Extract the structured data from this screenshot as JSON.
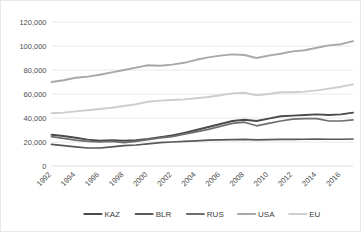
{
  "chart_data": {
    "type": "line",
    "title": "",
    "xlabel": "",
    "ylabel": "",
    "ylim": [
      0,
      120000
    ],
    "ytick_labels": [
      "120,000",
      "100,000",
      "80,000",
      "60,000",
      "40,000",
      "20,000",
      "0"
    ],
    "ytick_values": [
      120000,
      100000,
      80000,
      60000,
      40000,
      20000,
      0
    ],
    "grid": "horizontal",
    "legend_position": "bottom",
    "x": [
      1992,
      1993,
      1994,
      1995,
      1996,
      1997,
      1998,
      1999,
      2000,
      2001,
      2002,
      2003,
      2004,
      2005,
      2006,
      2007,
      2008,
      2009,
      2010,
      2011,
      2012,
      2013,
      2014,
      2015,
      2016,
      2017
    ],
    "xtick_labels": [
      "1992",
      "1994",
      "1996",
      "1998",
      "2000",
      "2002",
      "2004",
      "2006",
      "2008",
      "2010",
      "2012",
      "2014",
      "2016"
    ],
    "xtick_values": [
      1992,
      1994,
      1996,
      1998,
      2000,
      2002,
      2004,
      2006,
      2008,
      2010,
      2012,
      2014,
      2016
    ],
    "series": [
      {
        "name": "KAZ",
        "color": "#4a4a4a",
        "width": 1.9,
        "values": [
          26000,
          25000,
          23500,
          22000,
          21000,
          21500,
          21000,
          21500,
          22500,
          24000,
          25500,
          27500,
          30000,
          32500,
          35000,
          37500,
          38500,
          37500,
          39500,
          41500,
          42000,
          42500,
          43000,
          42500,
          43000,
          44500
        ]
      },
      {
        "name": "BLR",
        "color": "#585858",
        "width": 1.7,
        "values": [
          18000,
          17000,
          16000,
          15000,
          15000,
          16000,
          17000,
          17500,
          18500,
          19500,
          20000,
          20500,
          21000,
          21500,
          21800,
          22000,
          22200,
          21800,
          22000,
          22200,
          22200,
          22300,
          22400,
          22300,
          22300,
          22500
        ]
      },
      {
        "name": "RUS",
        "color": "#6e6e6e",
        "width": 1.7,
        "values": [
          24500,
          23000,
          21500,
          20500,
          20000,
          20500,
          19500,
          20500,
          22000,
          23500,
          24500,
          26500,
          28500,
          30500,
          33000,
          35500,
          36500,
          33500,
          35500,
          37500,
          39000,
          39500,
          39500,
          37500,
          37500,
          38500
        ]
      },
      {
        "name": "USA",
        "color": "#a8a8a8",
        "width": 1.9,
        "values": [
          70000,
          71500,
          73500,
          74500,
          76000,
          78000,
          80000,
          82000,
          84000,
          83500,
          84500,
          86000,
          88500,
          90500,
          92000,
          93000,
          92500,
          90000,
          92000,
          93500,
          95500,
          96500,
          98500,
          100500,
          101500,
          104000
        ]
      },
      {
        "name": "EU",
        "color": "#cdcdcd",
        "width": 1.9,
        "values": [
          44000,
          44500,
          45500,
          46500,
          47500,
          48500,
          50000,
          51500,
          53500,
          54500,
          55000,
          55500,
          56500,
          57500,
          59000,
          60500,
          61000,
          59000,
          60000,
          61500,
          61500,
          62000,
          63000,
          64500,
          66000,
          68000
        ]
      }
    ]
  },
  "legend": {
    "items": [
      {
        "label": "KAZ"
      },
      {
        "label": "BLR"
      },
      {
        "label": "RUS"
      },
      {
        "label": "USA"
      },
      {
        "label": "EU"
      }
    ]
  }
}
